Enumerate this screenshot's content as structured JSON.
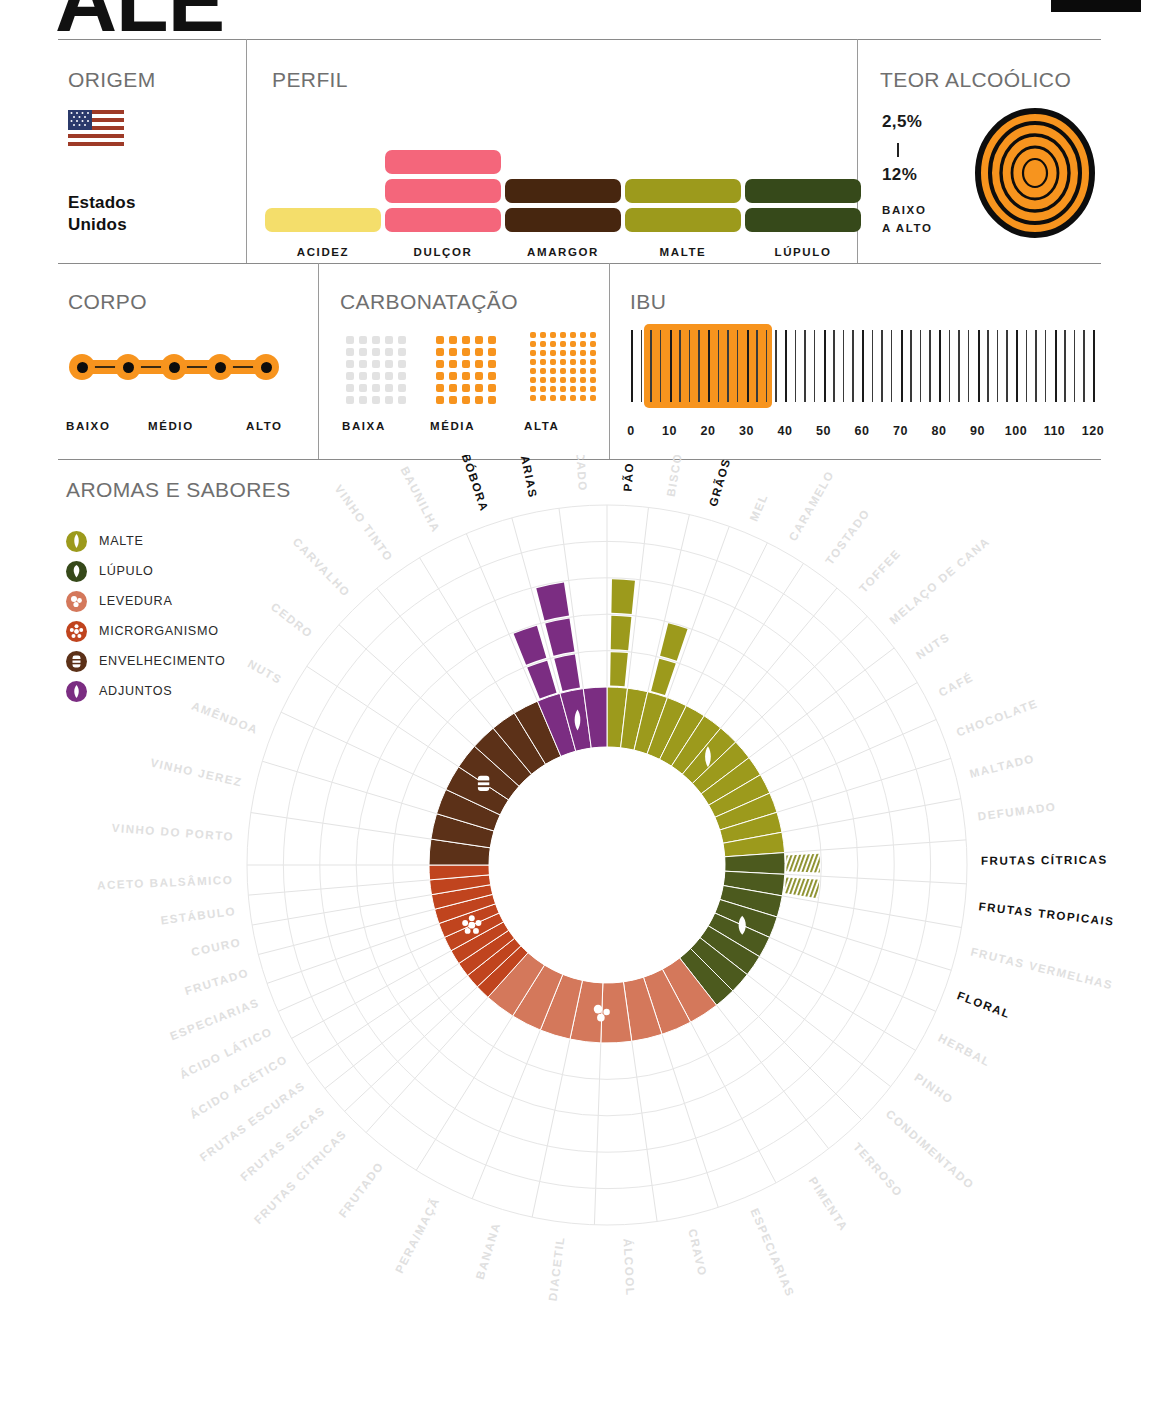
{
  "header": {
    "style_name": "ALE",
    "corner_mark": "black-bar"
  },
  "panels": {
    "origem": {
      "title": "ORIGEM",
      "country": "Estados\nUnidos",
      "country_line1": "Estados",
      "country_line2": "Unidos",
      "flag_icon": "usa-flag-icon"
    },
    "perfil": {
      "title": "PERFIL",
      "items": [
        {
          "label": "ACIDEZ",
          "value": 1,
          "color": "#F4DE6B"
        },
        {
          "label": "DULÇOR",
          "value": 3,
          "color": "#F4667B"
        },
        {
          "label": "AMARGOR",
          "value": 2,
          "color": "#47260F"
        },
        {
          "label": "MALTE",
          "value": 2,
          "color": "#9C9A1C"
        },
        {
          "label": "LÚPULO",
          "value": 2,
          "color": "#36491A"
        }
      ],
      "max": 3
    },
    "teor_alcoolico": {
      "title": "TEOR ALCOÓLICO",
      "min": "2,5%",
      "max": "12%",
      "range_caption_line1": "BAIXO",
      "range_caption_line2": "A ALTO",
      "icon": "concentric-rings-icon",
      "color": "#F7941E"
    },
    "corpo": {
      "title": "CORPO",
      "scale": [
        "BAIXO",
        "MÉDIO",
        "ALTO"
      ],
      "dots": 5,
      "filled": 5,
      "color": "#F7941E"
    },
    "carbonatacao": {
      "title": "CARBONATAÇÃO",
      "levels": [
        {
          "label": "BAIXA",
          "active": false,
          "color": "#E2E2E2",
          "rows": 6,
          "cols": 5
        },
        {
          "label": "MÉDIA",
          "active": true,
          "color": "#F7941E",
          "rows": 6,
          "cols": 5
        },
        {
          "label": "ALTA",
          "active": true,
          "color": "#F7941E",
          "rows": 8,
          "cols": 7
        }
      ]
    },
    "ibu": {
      "title": "IBU",
      "ticks": [
        0,
        10,
        20,
        30,
        40,
        50,
        60,
        70,
        80,
        90,
        100,
        110,
        120
      ],
      "range_min": 5,
      "range_max": 35,
      "scale_min": 0,
      "scale_max": 120,
      "highlight_color": "#F7941E"
    }
  },
  "aromas": {
    "title": "AROMAS E SABORES",
    "legend": [
      {
        "label": "MALTE",
        "color": "#9C9A1C",
        "icon": "malt-grain-icon"
      },
      {
        "label": "LÚPULO",
        "color": "#36491A",
        "icon": "hop-cone-icon"
      },
      {
        "label": "LEVEDURA",
        "color": "#D4785B",
        "icon": "yeast-bubbles-icon"
      },
      {
        "label": "MICRORGANISMO",
        "color": "#C0441E",
        "icon": "microorganism-icon"
      },
      {
        "label": "ENVELHECIMENTO",
        "color": "#5C3118",
        "icon": "barrel-icon"
      },
      {
        "label": "ADJUNTOS",
        "color": "#7B2D82",
        "icon": "adjunct-drop-icon"
      }
    ]
  },
  "chart_data": {
    "type": "pie",
    "title": "AROMAS E SABORES",
    "legend_position": "left",
    "inner_radius": 118,
    "ring_outer_radius": 178,
    "grid_outer_radius": 360,
    "grid_rings": 5,
    "categories": [
      {
        "name": "MALTE",
        "color": "#9C9A1C",
        "start_angle": -90,
        "end_angle": -4,
        "icon": "malt-grain-icon",
        "descriptors": [
          {
            "label": "PÃO",
            "active": true,
            "rays": 3
          },
          {
            "label": "BISCOITO",
            "active": false,
            "rays": 0
          },
          {
            "label": "GRÃOS",
            "active": true,
            "rays": 2
          },
          {
            "label": "MEL",
            "active": false,
            "rays": 0
          },
          {
            "label": "CARAMELO",
            "active": false,
            "rays": 0
          },
          {
            "label": "TOSTADO",
            "active": false,
            "rays": 0
          },
          {
            "label": "TOFFEE",
            "active": false,
            "rays": 0
          },
          {
            "label": "MELAÇO DE CANA",
            "active": false,
            "rays": 0
          },
          {
            "label": "NUTS",
            "active": false,
            "rays": 0
          },
          {
            "label": "CAFÉ",
            "active": false,
            "rays": 0
          },
          {
            "label": "CHOCOLATE",
            "active": false,
            "rays": 0
          },
          {
            "label": "MALTADO",
            "active": false,
            "rays": 0
          },
          {
            "label": "DEFUMADO",
            "active": false,
            "rays": 0
          }
        ]
      },
      {
        "name": "LÚPULO",
        "color": "#4C5A1E",
        "start_angle": -4,
        "end_angle": 52,
        "icon": "hop-cone-icon",
        "descriptors": [
          {
            "label": "FRUTAS CÍTRICAS",
            "active": true,
            "rays": 1,
            "hatched": true
          },
          {
            "label": "FRUTAS TROPICAIS",
            "active": true,
            "rays": 1,
            "hatched": true
          },
          {
            "label": "FRUTAS VERMELHAS",
            "active": false,
            "rays": 0
          },
          {
            "label": "FLORAL",
            "active": true,
            "rays": 0
          },
          {
            "label": "HERBAL",
            "active": false,
            "rays": 0
          },
          {
            "label": "PINHO",
            "active": false,
            "rays": 0
          },
          {
            "label": "CONDIMENTADO",
            "active": false,
            "rays": 0
          },
          {
            "label": "TERROSO",
            "active": false,
            "rays": 0
          }
        ]
      },
      {
        "name": "LEVEDURA",
        "color": "#D4785B",
        "start_angle": 52,
        "end_angle": 132,
        "icon": "yeast-bubbles-icon",
        "descriptors": [
          {
            "label": "PIMENTA",
            "active": false,
            "rays": 0
          },
          {
            "label": "ESPECIARIAS",
            "active": false,
            "rays": 0
          },
          {
            "label": "CRAVO",
            "active": false,
            "rays": 0
          },
          {
            "label": "ÁLCOOL",
            "active": false,
            "rays": 0
          },
          {
            "label": "DIACETIL",
            "active": false,
            "rays": 0
          },
          {
            "label": "BANANA",
            "active": false,
            "rays": 0
          },
          {
            "label": "PERA/MAÇÃ",
            "active": false,
            "rays": 0
          },
          {
            "label": "FRUTADO",
            "active": false,
            "rays": 0
          }
        ]
      },
      {
        "name": "MICRORGANISMO",
        "color": "#C0441E",
        "start_angle": 132,
        "end_angle": 180,
        "icon": "microorganism-icon",
        "descriptors": [
          {
            "label": "FRUTAS CÍTRICAS",
            "active": false,
            "rays": 0
          },
          {
            "label": "FRUTAS SECAS",
            "active": false,
            "rays": 0
          },
          {
            "label": "FRUTAS ESCURAS",
            "active": false,
            "rays": 0
          },
          {
            "label": "ÁCIDO ACÉTICO",
            "active": false,
            "rays": 0
          },
          {
            "label": "ÁCIDO LÁTICO",
            "active": false,
            "rays": 0
          },
          {
            "label": "ESPECIARIAS",
            "active": false,
            "rays": 0
          },
          {
            "label": "FRUTADO",
            "active": false,
            "rays": 0
          },
          {
            "label": "COURO",
            "active": false,
            "rays": 0
          },
          {
            "label": "ESTÁBULO",
            "active": false,
            "rays": 0
          },
          {
            "label": "ACETO BALSÂMICO",
            "active": false,
            "rays": 0
          }
        ]
      },
      {
        "name": "ENVELHECIMENTO",
        "color": "#5C3118",
        "start_angle": 180,
        "end_angle": 247,
        "icon": "barrel-icon",
        "descriptors": [
          {
            "label": "VINHO DO PORTO",
            "active": false,
            "rays": 0
          },
          {
            "label": "VINHO JEREZ",
            "active": false,
            "rays": 0
          },
          {
            "label": "AMÊNDOA",
            "active": false,
            "rays": 0
          },
          {
            "label": "NUTS",
            "active": false,
            "rays": 0
          },
          {
            "label": "CEDRO",
            "active": false,
            "rays": 0
          },
          {
            "label": "CARVALHO",
            "active": false,
            "rays": 0
          },
          {
            "label": "VINHO TINTO",
            "active": false,
            "rays": 0
          },
          {
            "label": "BAUNILHA",
            "active": false,
            "rays": 0
          }
        ]
      },
      {
        "name": "ADJUNTOS",
        "color": "#7B2D82",
        "start_angle": 247,
        "end_angle": 270,
        "icon": "adjunct-drop-icon",
        "descriptors": [
          {
            "label": "ABÓBORA",
            "active": true,
            "rays": 2
          },
          {
            "label": "ESPECIARIAS",
            "active": true,
            "rays": 3
          },
          {
            "label": "ADOCICADO",
            "active": false,
            "rays": 0
          }
        ]
      }
    ],
    "labels_ring_order": [
      "PÃO",
      "BISCOITO",
      "GRÃOS",
      "MEL",
      "CARAMELO",
      "TOSTADO",
      "TOFFEE",
      "MELAÇO DE CANA",
      "NUTS",
      "CAFÉ",
      "CHOCOLATE",
      "MALTADO",
      "DEFUMADO",
      "FRUTAS CÍTRICAS",
      "FRUTAS TROPICAIS",
      "FRUTAS VERMELHAS",
      "FLORAL",
      "HERBAL",
      "PINHO",
      "CONDIMENTADO",
      "TERROSO",
      "PIMENTA",
      "ESPECIARIAS",
      "CRAVO",
      "ÁLCOOL",
      "DIACETIL",
      "BANANA",
      "PERA/MAÇÃ",
      "FRUTADO",
      "FRUTAS CÍTRICAS",
      "FRUTAS SECAS",
      "FRUTAS ESCURAS",
      "ÁCIDO ACÉTICO",
      "ÁCIDO LÁTICO",
      "ESPECIARIAS",
      "FRUTADO",
      "COURO",
      "ESTÁBULO",
      "ACETO BALSÂMICO",
      "VINHO DO PORTO",
      "VINHO JEREZ",
      "AMÊNDOA",
      "NUTS",
      "CEDRO",
      "CARVALHO",
      "VINHO TINTO",
      "BAUNILHA",
      "ABÓBORA",
      "ESPECIARIAS",
      "ADOCICADO"
    ]
  }
}
